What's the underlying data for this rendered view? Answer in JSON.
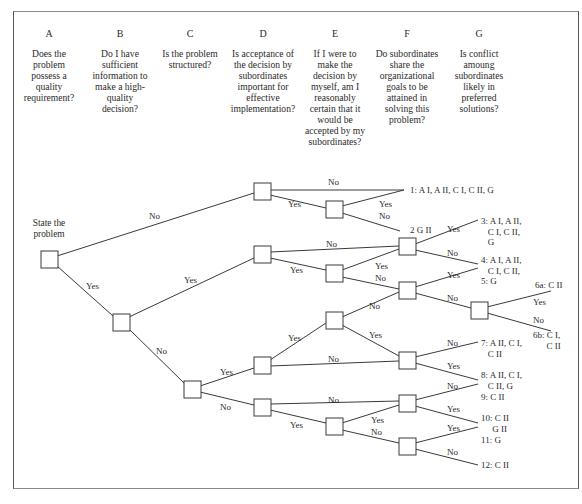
{
  "columns": [
    {
      "letter": "A",
      "question": "Does the problem possess a quality requirement?"
    },
    {
      "letter": "B",
      "question": "Do I have sufficient information to make a high-quality decision?"
    },
    {
      "letter": "C",
      "question": "Is the problem structured?"
    },
    {
      "letter": "D",
      "question": "Is acceptance of the decision by subordinates important for effective implementation?"
    },
    {
      "letter": "E",
      "question": "If I were to make the decision by myself, am I reasonably certain that it would be accepted by my subordinates?"
    },
    {
      "letter": "F",
      "question": "Do subordinates share the organizational goals to be attained in solving this problem?"
    },
    {
      "letter": "G",
      "question": "Is conflict amoung subordinates likely in preferred solutions?"
    }
  ],
  "start_label": "State the problem",
  "branch_labels": {
    "yes": "Yes",
    "no": "No"
  },
  "outcomes": [
    {
      "id": "1",
      "text": "1: A I, A II, C I, C II, G"
    },
    {
      "id": "2",
      "text": "2 G II"
    },
    {
      "id": "3",
      "text": "3: A I, A II,\n   C I, C II,\n   G"
    },
    {
      "id": "4",
      "text": "4: A I, A II,\n   C I, C II,"
    },
    {
      "id": "5",
      "text": "5: G"
    },
    {
      "id": "6a",
      "text": "6a: C II"
    },
    {
      "id": "6b",
      "text": "6b: C I,\n      C II"
    },
    {
      "id": "7",
      "text": "7: A II, C I,\n   C II"
    },
    {
      "id": "8",
      "text": "8: A II, C I,\n   C II, G"
    },
    {
      "id": "9",
      "text": "9: C II"
    },
    {
      "id": "10",
      "text": "10: C II\n     G II"
    },
    {
      "id": "11",
      "text": "11: G"
    },
    {
      "id": "12",
      "text": "12: C II"
    }
  ],
  "colors": {
    "line": "#3a3a3a",
    "text": "#2a2a2a",
    "frame": "#666666",
    "background": "#ffffff"
  }
}
